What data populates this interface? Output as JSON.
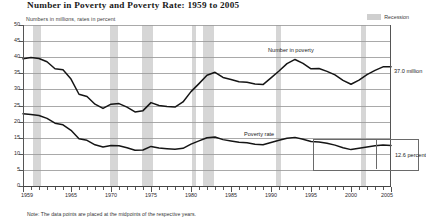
{
  "header": {
    "title": "Number in Poverty and Poverty Rate:  1959 to 2005",
    "subtitle": "Numbers in millions, rates in percent"
  },
  "legend": {
    "recession_label": "Recession",
    "recession_color": "#d2d2d2"
  },
  "annotations": {
    "number_in_poverty": "Number in poverty",
    "poverty_rate": "Poverty rate",
    "number_value": "37.0 million",
    "rate_value": "12.6 percent"
  },
  "note": "Note:  The data points are placed at the midpoints of the respective years.",
  "chart_data": {
    "type": "line",
    "title": "Number in Poverty and Poverty Rate:  1959 to 2005",
    "subtitle": "Numbers in millions, rates in percent",
    "xlabel": "",
    "ylabel": "",
    "xlim": [
      1959,
      2005
    ],
    "ylim": [
      0,
      50
    ],
    "ytick_step": 5,
    "yticks": [
      0,
      5,
      10,
      15,
      20,
      25,
      30,
      35,
      40,
      45,
      50
    ],
    "xticks_major": [
      1959,
      1965,
      1970,
      1975,
      1980,
      1985,
      1990,
      1995,
      2000,
      2005
    ],
    "xticks_minor_every": 1,
    "grid": true,
    "legend_position": "top-right",
    "x": [
      1959,
      1960,
      1961,
      1962,
      1963,
      1964,
      1965,
      1966,
      1967,
      1968,
      1969,
      1970,
      1971,
      1972,
      1973,
      1974,
      1975,
      1976,
      1977,
      1978,
      1979,
      1980,
      1981,
      1982,
      1983,
      1984,
      1985,
      1986,
      1987,
      1988,
      1989,
      1990,
      1991,
      1992,
      1993,
      1994,
      1995,
      1996,
      1997,
      1998,
      1999,
      2000,
      2001,
      2002,
      2003,
      2004,
      2005
    ],
    "series": [
      {
        "name": "Number in poverty",
        "units": "millions",
        "end_label": "37.0 million",
        "values": [
          39.5,
          39.9,
          39.6,
          38.6,
          36.4,
          36.1,
          33.2,
          28.5,
          27.8,
          25.4,
          24.1,
          25.4,
          25.6,
          24.5,
          23.0,
          23.4,
          25.9,
          25.0,
          24.7,
          24.5,
          26.1,
          29.3,
          31.8,
          34.4,
          35.3,
          33.7,
          33.1,
          32.4,
          32.2,
          31.7,
          31.5,
          33.6,
          35.7,
          38.0,
          39.3,
          38.1,
          36.4,
          36.5,
          35.6,
          34.5,
          32.8,
          31.6,
          32.9,
          34.6,
          35.9,
          37.0,
          37.0
        ]
      },
      {
        "name": "Poverty rate",
        "units": "percent",
        "end_label": "12.6 percent",
        "values": [
          22.4,
          22.2,
          21.9,
          21.0,
          19.5,
          19.0,
          17.3,
          14.7,
          14.2,
          12.8,
          12.1,
          12.6,
          12.5,
          11.9,
          11.1,
          11.2,
          12.3,
          11.8,
          11.6,
          11.4,
          11.7,
          13.0,
          14.0,
          15.0,
          15.2,
          14.4,
          14.0,
          13.6,
          13.4,
          13.0,
          12.8,
          13.5,
          14.2,
          14.8,
          15.1,
          14.5,
          13.8,
          13.7,
          13.3,
          12.7,
          11.9,
          11.3,
          11.7,
          12.1,
          12.5,
          12.7,
          12.6
        ]
      }
    ],
    "recessions": [
      {
        "start": 1960.3,
        "end": 1961.2
      },
      {
        "start": 1969.9,
        "end": 1970.9
      },
      {
        "start": 1973.9,
        "end": 1975.2
      },
      {
        "start": 1980.1,
        "end": 1980.6
      },
      {
        "start": 1981.5,
        "end": 1982.9
      },
      {
        "start": 1990.6,
        "end": 1991.2
      },
      {
        "start": 2001.2,
        "end": 2001.9
      }
    ]
  }
}
